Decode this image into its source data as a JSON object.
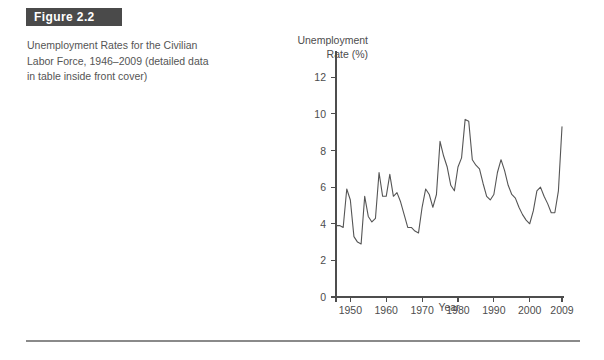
{
  "figure": {
    "header_label": "Figure 2.2",
    "caption_lines": [
      "Unemployment Rates for the Civilian",
      "Labor Force, 1946–2009 (detailed data",
      "in table inside front cover)"
    ],
    "header_bg_color": "#4a4a4a",
    "header_text_color": "#ffffff",
    "caption_text_color": "#555555",
    "rule_color": "#8a8a8a"
  },
  "chart_data": {
    "type": "line",
    "title": "",
    "subtitle": "",
    "ylabel_lines": [
      "Unemployment",
      "Rate (%)"
    ],
    "ylabel": "Unemployment Rate (%)",
    "xlabel": "Year",
    "xlim": [
      1946,
      2009
    ],
    "ylim": [
      0,
      13
    ],
    "yticks": [
      0,
      2,
      4,
      6,
      8,
      10,
      12
    ],
    "ytick_labels": [
      "0",
      "2",
      "4",
      "6",
      "8",
      "10",
      "12"
    ],
    "xticks": [
      1950,
      1960,
      1970,
      1980,
      1990,
      2000,
      2009
    ],
    "xtick_labels": [
      "1950",
      "1960",
      "1970",
      "1980",
      "1990",
      "2000",
      "2009"
    ],
    "grid": false,
    "legend": false,
    "line_color": "#555555",
    "series": [
      {
        "name": "Civilian unemployment rate",
        "x": [
          1946,
          1947,
          1948,
          1949,
          1950,
          1951,
          1952,
          1953,
          1954,
          1955,
          1956,
          1957,
          1958,
          1959,
          1960,
          1961,
          1962,
          1963,
          1964,
          1965,
          1966,
          1967,
          1968,
          1969,
          1970,
          1971,
          1972,
          1973,
          1974,
          1975,
          1976,
          1977,
          1978,
          1979,
          1980,
          1981,
          1982,
          1983,
          1984,
          1985,
          1986,
          1987,
          1988,
          1989,
          1990,
          1991,
          1992,
          1993,
          1994,
          1995,
          1996,
          1997,
          1998,
          1999,
          2000,
          2001,
          2002,
          2003,
          2004,
          2005,
          2006,
          2007,
          2008,
          2009
        ],
        "values": [
          3.9,
          3.9,
          3.8,
          5.9,
          5.3,
          3.3,
          3.0,
          2.9,
          5.5,
          4.4,
          4.1,
          4.3,
          6.8,
          5.5,
          5.5,
          6.7,
          5.5,
          5.7,
          5.2,
          4.5,
          3.8,
          3.8,
          3.6,
          3.5,
          4.9,
          5.9,
          5.6,
          4.9,
          5.6,
          8.5,
          7.7,
          7.1,
          6.1,
          5.8,
          7.1,
          7.6,
          9.7,
          9.6,
          7.5,
          7.2,
          7.0,
          6.2,
          5.5,
          5.3,
          5.6,
          6.8,
          7.5,
          6.9,
          6.1,
          5.6,
          5.4,
          4.9,
          4.5,
          4.2,
          4.0,
          4.7,
          5.8,
          6.0,
          5.5,
          5.1,
          4.6,
          4.6,
          5.8,
          9.3
        ]
      }
    ]
  }
}
